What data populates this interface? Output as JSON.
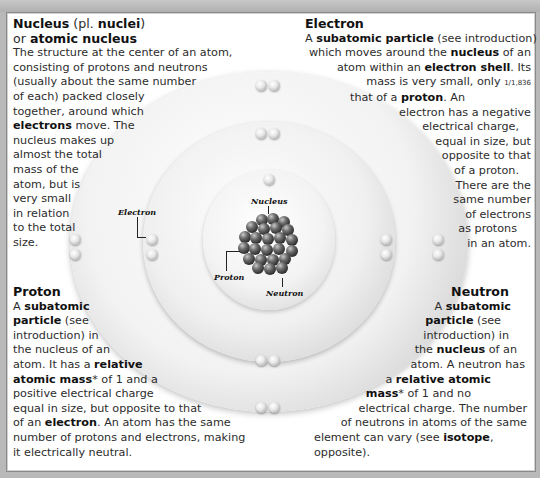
{
  "diagram": {
    "labels": {
      "nucleus": "Nucleus",
      "proton": "Proton",
      "neutron": "Neutron",
      "electron": "Electron"
    }
  },
  "nucleus_panel": {
    "heading_bold_1": "Nucleus",
    "heading_plain_1": " (pl. ",
    "heading_bold_2": "nuclei",
    "heading_plain_2": ")",
    "heading2_plain": "or ",
    "heading2_bold": "atomic nucleus",
    "lines": [
      "The structure at the center of an atom,",
      "consisting of protons and neutrons",
      "(usually about the same number",
      "of each) packed closely",
      "together, around which"
    ],
    "line6_bold": "electrons",
    "line6_rest": " move. The",
    "lines_after": [
      "nucleus makes up",
      "almost the total",
      "mass of the",
      "atom, but is",
      "very small",
      "in relation",
      "to the total",
      "size."
    ]
  },
  "electron_panel": {
    "heading": "Electron",
    "l1_a": "A ",
    "l1_b": "subatomic particle",
    "l1_c": " (see introduction)",
    "l2_a": "which moves around the ",
    "l2_b": "nucleus",
    "l2_c": " of an",
    "l3_a": "atom within an ",
    "l3_b": "electron shell",
    "l3_c": ". Its",
    "l4_a": "mass is very small, only ",
    "l4_frac": "1/1,836",
    "l5_a": "that of a ",
    "l5_b": "proton",
    "l5_c": ". An",
    "lines_after": [
      "electron has a negative",
      "electrical charge,",
      "equal in size, but",
      "opposite to that",
      "of a proton.",
      "There are the",
      "same number",
      "of electrons",
      "as protons",
      "in an atom."
    ]
  },
  "proton_panel": {
    "heading": "Proton",
    "l1_a": "A ",
    "l1_b": "subatomic",
    "l2_b": "particle",
    "l2_c": " (see",
    "l3": "introduction) in",
    "l4": "the nucleus of an",
    "l5_a": "atom. It has a ",
    "l5_b": "relative",
    "l6_b": "atomic mass",
    "l6_c": "* of 1 and a",
    "l7": "positive electrical charge",
    "l8": "equal in size, but opposite to that",
    "l9_a": "of an ",
    "l9_b": "electron",
    "l9_c": ". An atom has the same",
    "l10": "number of protons and electrons, making",
    "l11": "it electrically neutral."
  },
  "neutron_panel": {
    "heading": "Neutron",
    "l1_a": "A ",
    "l1_b": "subatomic",
    "l2_b": "particle",
    "l2_c": " (see",
    "l3": "introduction) in",
    "l4_a": "the ",
    "l4_b": "nucleus",
    "l4_c": " of an",
    "l5": "atom. A neutron has",
    "l6_a": "a ",
    "l6_b": "relative atomic",
    "l7_b": "mass",
    "l7_c": "* of 1 and no",
    "l8": "electrical charge. The number",
    "l9": "of neutrons in atoms of the same",
    "l10_a": "element can vary (see ",
    "l10_b": "isotope",
    "l10_c": ",",
    "l11": "opposite)."
  },
  "colors": {
    "background": "#b9b9b9",
    "page": "#ffffff",
    "text": "#2c2c2c",
    "shell_light": "#f2f2f2",
    "shell_dark": "#bdbdbd",
    "nucleus_particle": "#2a2a2a"
  }
}
